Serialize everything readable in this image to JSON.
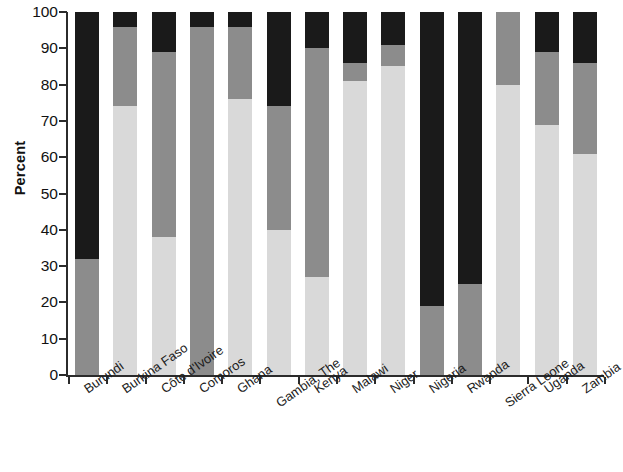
{
  "chart_data": {
    "type": "bar",
    "subtype": "stacked-bar-100",
    "title": "",
    "xlabel": "",
    "ylabel": "Percent",
    "ylim": [
      0,
      100
    ],
    "yticks": [
      0,
      10,
      20,
      30,
      40,
      50,
      60,
      70,
      80,
      90,
      100
    ],
    "ytick_labels": [
      "0",
      "10",
      "20",
      "30",
      "40",
      "50",
      "60",
      "70",
      "80",
      "90",
      "100"
    ],
    "grid": false,
    "legend": "none",
    "categories": [
      "Burundi",
      "Burkina Faso",
      "Côte d'Ivoire",
      "Comoros",
      "Ghana",
      "Gambia, The",
      "Kenya",
      "Malawi",
      "Niger",
      "Nigeria",
      "Rwanda",
      "Sierra Leone",
      "Uganda",
      "Zambia"
    ],
    "series": [
      {
        "name": "light-gray-segment",
        "color": "#d9d9d9",
        "values": [
          0,
          74,
          38,
          0,
          76,
          40,
          27,
          81,
          85,
          0,
          0,
          80,
          69,
          61
        ]
      },
      {
        "name": "medium-gray-segment",
        "color": "#8c8c8c",
        "values": [
          32,
          22,
          51,
          96,
          20,
          34,
          63,
          5,
          6,
          19,
          25,
          20,
          20,
          25
        ]
      },
      {
        "name": "black-segment",
        "color": "#1a1a1a",
        "values": [
          68,
          4,
          11,
          4,
          4,
          26,
          10,
          14,
          9,
          81,
          75,
          0,
          11,
          14
        ]
      }
    ],
    "stack_tops": {
      "light_gray_top": [
        0,
        74,
        38,
        0,
        76,
        40,
        27,
        81,
        85,
        0,
        0,
        80,
        69,
        61
      ],
      "medium_gray_top": [
        32,
        96,
        89,
        96,
        96,
        74,
        90,
        86,
        91,
        19,
        25,
        100,
        89,
        86
      ],
      "black_top": [
        100,
        100,
        100,
        100,
        100,
        100,
        100,
        100,
        100,
        100,
        100,
        100,
        100,
        100
      ]
    }
  },
  "axis": {
    "y_title": "Percent"
  },
  "colors": {
    "black": "#1a1a1a",
    "medium_gray": "#8c8c8c",
    "light_gray": "#d9d9d9",
    "axis": "#2b2b2b",
    "background": "#ffffff"
  }
}
